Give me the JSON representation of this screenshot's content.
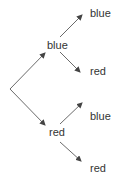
{
  "diagram": {
    "type": "probability-tree",
    "root": {
      "x": 10,
      "y": 89
    },
    "colors": {
      "line": "#444444",
      "text": "#333333",
      "background": "#ffffff"
    },
    "level1": [
      {
        "label": "blue",
        "label_pos": {
          "x": 47,
          "y": 40
        },
        "arrow_from": {
          "x": 10,
          "y": 89
        },
        "arrow_to": {
          "x": 45,
          "y": 53
        }
      },
      {
        "label": "red",
        "label_pos": {
          "x": 49,
          "y": 126
        },
        "arrow_from": {
          "x": 10,
          "y": 89
        },
        "arrow_to": {
          "x": 45,
          "y": 125
        }
      }
    ],
    "level2": [
      {
        "parent": "blue",
        "label": "blue",
        "label_pos": {
          "x": 90,
          "y": 9
        },
        "arrow_from": {
          "x": 60,
          "y": 37
        },
        "arrow_to": {
          "x": 82,
          "y": 15
        }
      },
      {
        "parent": "blue",
        "label": "red",
        "label_pos": {
          "x": 90,
          "y": 66
        },
        "arrow_from": {
          "x": 60,
          "y": 52
        },
        "arrow_to": {
          "x": 80,
          "y": 72
        }
      },
      {
        "parent": "red",
        "label": "blue",
        "label_pos": {
          "x": 90,
          "y": 111
        },
        "arrow_from": {
          "x": 60,
          "y": 124
        },
        "arrow_to": {
          "x": 82,
          "y": 103
        }
      },
      {
        "parent": "red",
        "label": "red",
        "label_pos": {
          "x": 90,
          "y": 163
        },
        "arrow_from": {
          "x": 60,
          "y": 142
        },
        "arrow_to": {
          "x": 81,
          "y": 161
        }
      }
    ]
  }
}
